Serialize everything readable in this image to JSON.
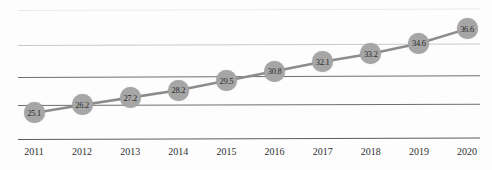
{
  "chart_data": {
    "type": "line",
    "title": "",
    "subtitle": "",
    "xlabel": "",
    "ylabel": "",
    "categories": [
      "2011",
      "2012",
      "2013",
      "2014",
      "2015",
      "2016",
      "2017",
      "2018",
      "2019",
      "2020"
    ],
    "values": [
      25.1,
      26.2,
      27.2,
      28.2,
      29.5,
      30.8,
      32.1,
      33.2,
      34.6,
      36.6
    ],
    "point_labels": [
      "25.1",
      "26.2",
      "27.2",
      "28.2",
      "29.5",
      "30.8",
      "32.1",
      "33.2",
      "34.6",
      "36.6"
    ],
    "series": [
      {
        "name": "",
        "values": [
          25.1,
          26.2,
          27.2,
          28.2,
          29.5,
          30.8,
          32.1,
          33.2,
          34.6,
          36.6
        ]
      }
    ],
    "ylim": [
      22.5,
      40.0
    ],
    "grid": true,
    "gridlines_count": 4,
    "legend": false,
    "legend_position": "none",
    "marker_color": "#a6a6a6",
    "line_color": "#8c8c8c",
    "label_color": "#2b2b2b",
    "axis_color": "#5d5d5d",
    "background_color": "#fdfdfd"
  },
  "axis": {
    "ticks": [
      "2011",
      "2012",
      "2013",
      "2014",
      "2015",
      "2016",
      "2017",
      "2018",
      "2019",
      "2020"
    ]
  }
}
